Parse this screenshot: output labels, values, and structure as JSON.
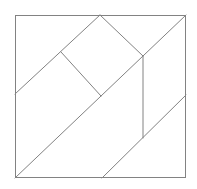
{
  "figure": {
    "background": "#ffffff",
    "line_color": "#828282",
    "line_width": 1,
    "canvas": {
      "width": 197,
      "height": 189
    },
    "outer_square": {
      "x": 15,
      "y": 15,
      "width": 171,
      "height": 163
    },
    "segments": [
      {
        "name": "main-diagonal-bottomleft-to-topright",
        "x1": 15,
        "y1": 178,
        "x2": 186,
        "y2": 15
      },
      {
        "name": "left-edge-to-top-apex",
        "x1": 15,
        "y1": 94,
        "x2": 100,
        "y2": 15
      },
      {
        "name": "inner-square-lower-left-side",
        "x1": 61,
        "y1": 52,
        "x2": 101,
        "y2": 96
      },
      {
        "name": "inner-square-upper-right-side",
        "x1": 100,
        "y1": 15,
        "x2": 143,
        "y2": 56
      },
      {
        "name": "vertical-cut",
        "x1": 143,
        "y1": 56,
        "x2": 143,
        "y2": 138
      },
      {
        "name": "right-edge-to-bottom-edge-cut",
        "x1": 186,
        "y1": 95,
        "x2": 102,
        "y2": 178
      }
    ]
  }
}
